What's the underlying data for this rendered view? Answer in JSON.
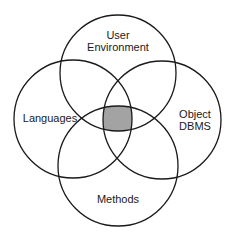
{
  "diagram": {
    "type": "venn",
    "circle_count": 4,
    "stroke_color": "#1a1a1a",
    "intersection_fill": "#a3a3a3",
    "sets": [
      {
        "id": "user-environment",
        "label_lines": [
          "User",
          "Environment"
        ],
        "position": "top"
      },
      {
        "id": "languages",
        "label_lines": [
          "Languages"
        ],
        "position": "left"
      },
      {
        "id": "object-dbms",
        "label_lines": [
          "Object",
          "DBMS"
        ],
        "position": "right"
      },
      {
        "id": "methods",
        "label_lines": [
          "Methods"
        ],
        "position": "bottom"
      }
    ],
    "highlighted_region": "intersection of all four sets"
  }
}
